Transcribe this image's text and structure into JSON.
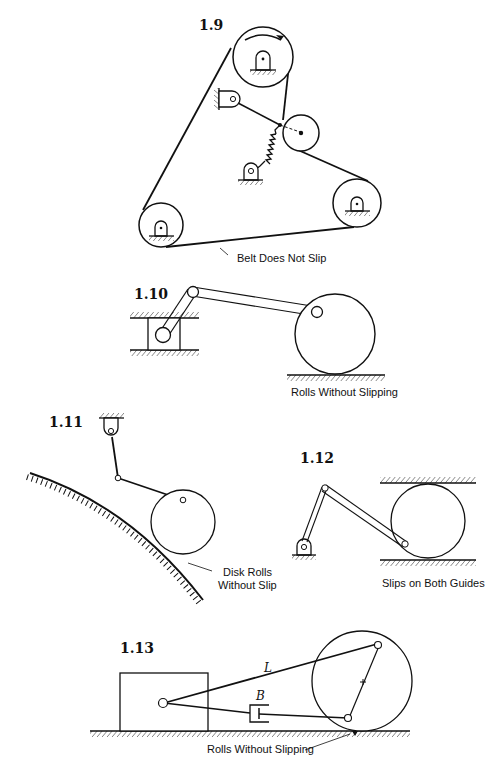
{
  "page": {
    "figures": [
      {
        "id": "1.9",
        "label": "1.9",
        "caption": "Belt Does Not Slip"
      },
      {
        "id": "1.10",
        "label": "1.10",
        "caption": "Rolls Without Slipping"
      },
      {
        "id": "1.11",
        "label": "1.11",
        "caption_line1": "Disk Rolls",
        "caption_line2": "Without Slip"
      },
      {
        "id": "1.12",
        "label": "1.12",
        "caption": "Slips on Both Guides"
      },
      {
        "id": "1.13",
        "label": "1.13",
        "caption": "Rolls Without Slipping",
        "var_L": "L",
        "var_B": "B"
      }
    ]
  },
  "colors": {
    "ink": "#111111",
    "paper": "#ffffff"
  }
}
